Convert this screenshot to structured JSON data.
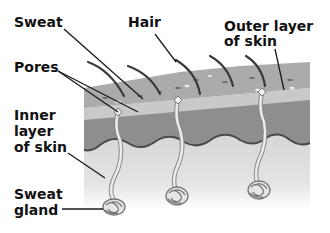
{
  "diagram": {
    "labels": {
      "sweat": "Sweat",
      "hair": "Hair",
      "outer_layer": "Outer layer\nof skin",
      "pores": "Pores",
      "inner_layer": "Inner\nlayer\nof skin",
      "sweat_gland": "Sweat\ngland"
    },
    "colors": {
      "outer_layer": "#a9a9a9",
      "outer_band": "#c8c8c8",
      "dermis_band": "#8c8c8c",
      "inner_layer": "#d6d6d6",
      "wave_line": "#4a4a4a",
      "hair": "#3a3a3a",
      "leader": "#1a1a1a",
      "gland": "#e8e8e8"
    }
  }
}
